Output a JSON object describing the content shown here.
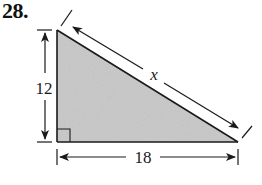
{
  "problem": {
    "number": "28."
  },
  "triangle": {
    "type": "right-triangle",
    "fill_color": "#c8c8c8",
    "stroke_color": "#1a1a1a",
    "vertices": {
      "top": [
        57,
        30
      ],
      "right_angle": [
        57,
        142
      ],
      "bottom_right": [
        238,
        142
      ]
    }
  },
  "labels": {
    "vertical_leg": "12",
    "horizontal_leg": "18",
    "hypotenuse": "x"
  },
  "colors": {
    "line": "#1a1a1a",
    "fill": "#c8c8c8",
    "background": "#ffffff"
  }
}
